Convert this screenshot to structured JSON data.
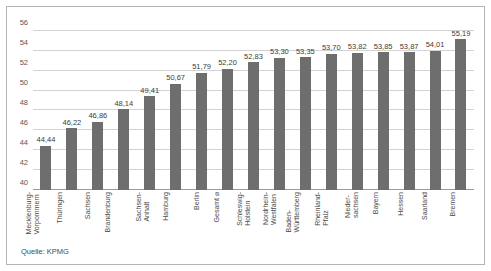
{
  "source_note": "Quelle: KPMG",
  "style": {
    "bar_color": "#6e6e6e",
    "grid_color": "#d3d3d3",
    "axis_color": "#9a9a9a",
    "text_color": "#4a4a4a",
    "background": "#ffffff"
  },
  "chart_data": {
    "type": "bar",
    "title": "",
    "subtitle": "",
    "xlabel": "",
    "ylabel": "",
    "ylim": [
      40,
      57
    ],
    "yticks": [
      40,
      42,
      44,
      46,
      48,
      50,
      52,
      54,
      56
    ],
    "ytick_labels": [
      "40",
      "42",
      "44",
      "46",
      "48",
      "50",
      "52",
      "54",
      "56"
    ],
    "grid": true,
    "legend": false,
    "categories": [
      "Mecklenburg-Vorpommern",
      "Thüringen",
      "Sachsen",
      "Brandenburg",
      "Sachsen-Anhalt",
      "Hamburg",
      "Berlin",
      "Gesamt ⌀",
      "Schleswig-Holstein",
      "Nordrhein-Westfalen",
      "Baden-Württemberg",
      "Rheinland-Pfalz",
      "Niedersachsen",
      "Bayern",
      "Hessen",
      "Saarland",
      "Bremen"
    ],
    "category_lines": [
      [
        "Mecklenburg-",
        "Vorpommern"
      ],
      [
        "Thüringen",
        ""
      ],
      [
        "Sachsen",
        ""
      ],
      [
        "Brandenburg",
        ""
      ],
      [
        "Sachsen-",
        "Anhalt"
      ],
      [
        "Hamburg",
        ""
      ],
      [
        "Berlin",
        ""
      ],
      [
        "Gesamt ⌀",
        ""
      ],
      [
        "Schleswig-",
        "Holstein"
      ],
      [
        "Nordrhein-",
        "Westfalen"
      ],
      [
        "Baden-",
        "Württemberg"
      ],
      [
        "Rheinland-",
        "Pfalz"
      ],
      [
        "Nieder-",
        "sachsen"
      ],
      [
        "Bayern",
        ""
      ],
      [
        "Hessen",
        ""
      ],
      [
        "Saarland",
        ""
      ],
      [
        "Bremen",
        ""
      ]
    ],
    "values": [
      44.44,
      46.22,
      46.86,
      48.14,
      49.41,
      50.67,
      51.79,
      52.2,
      52.83,
      53.3,
      53.35,
      53.7,
      53.82,
      53.85,
      53.87,
      54.01,
      55.19
    ],
    "value_labels": [
      "44,44",
      "46,22",
      "46,86",
      "48,14",
      "49,41",
      "50,67",
      "51,79",
      "52,20",
      "52,83",
      "53,30",
      "53,35",
      "53,70",
      "53,82",
      "53,85",
      "53,87",
      "54,01",
      "55,19"
    ]
  }
}
